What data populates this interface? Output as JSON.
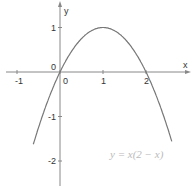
{
  "chart_data": {
    "type": "line",
    "title": "",
    "function": "y = x(2 - x)",
    "annotation": "y = x(2 − x)",
    "xlabel": "x",
    "ylabel": "y",
    "xlim": [
      -1.4,
      2.9
    ],
    "ylim": [
      -2.6,
      1.65
    ],
    "x_ticks": [
      -1,
      0,
      1,
      2
    ],
    "y_ticks": [
      -2,
      -1,
      0,
      1
    ],
    "x_tick_labels": [
      "-1",
      "0",
      "1",
      "2"
    ],
    "y_tick_labels": [
      "-2",
      "-1",
      "0",
      "1"
    ],
    "origin_label": "0",
    "series": [
      {
        "name": "y = x(2 - x)",
        "x": [
          -0.6,
          -0.4,
          -0.2,
          0,
          0.25,
          0.5,
          0.75,
          1,
          1.25,
          1.5,
          1.75,
          2,
          2.2,
          2.4,
          2.6
        ],
        "y": [
          -1.56,
          -0.96,
          -0.44,
          0,
          0.4375,
          0.75,
          0.9375,
          1,
          0.9375,
          0.75,
          0.4375,
          0,
          -0.44,
          -0.96,
          -1.56
        ]
      }
    ],
    "grid": false,
    "colors": {
      "curve": "#777777",
      "axes": "#888888",
      "annotation": "#bbbbbb"
    }
  }
}
